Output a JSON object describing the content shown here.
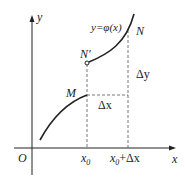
{
  "diagram": {
    "axis_labels": {
      "x": "x",
      "y": "y",
      "origin": "O"
    },
    "function_label": "y=φ(x)",
    "points": {
      "M": "M",
      "N_prime": "N'",
      "N": "N"
    },
    "ticks": {
      "x0": "x",
      "x0_sub": "0",
      "x0_dx": "x",
      "x0_dx_sub": "0",
      "x0_dx_rest": "+Δx"
    },
    "deltas": {
      "dx": "Δx",
      "dy": "Δy"
    },
    "colors": {
      "stroke": "#222222",
      "dashed": "#555555"
    }
  }
}
